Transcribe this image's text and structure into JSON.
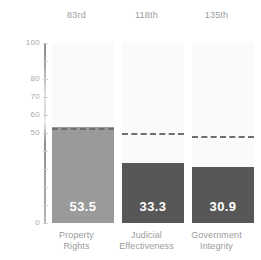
{
  "chart_data": {
    "type": "bar",
    "title": "",
    "subtitle": "",
    "xlabel": "",
    "ylabel": "",
    "ylim": [
      0,
      100
    ],
    "grid": false,
    "legend": "none",
    "categories": [
      "Property Rights",
      "Judicial Effectiveness",
      "Government Integrity"
    ],
    "category_lines": [
      [
        "Property",
        "Rights"
      ],
      [
        "Judicial",
        "Effectiveness"
      ],
      [
        "Government",
        "Integrity"
      ]
    ],
    "values": [
      53.5,
      33.3,
      30.9
    ],
    "value_labels": [
      "53.5",
      "33.3",
      "30.9"
    ],
    "rank_labels": [
      "83rd",
      "118th",
      "135th"
    ],
    "reference_lines": [
      52.6,
      49.8,
      48.4
    ],
    "reference_line_style": "dashed",
    "bar_colors": [
      "#9a9a9a",
      "#575757",
      "#575757"
    ],
    "y_ticks": [
      {
        "value": 100,
        "label": "100"
      },
      {
        "value": 90,
        "label": ""
      },
      {
        "value": 80,
        "label": "80"
      },
      {
        "value": 70,
        "label": "70"
      },
      {
        "value": 60,
        "label": "60"
      },
      {
        "value": 50,
        "label": "50"
      },
      {
        "value": 40,
        "label": ""
      },
      {
        "value": 30,
        "label": ""
      },
      {
        "value": 20,
        "label": ""
      },
      {
        "value": 10,
        "label": ""
      },
      {
        "value": 0,
        "label": "0"
      }
    ],
    "colors": {
      "bar_light": "#9a9a9a",
      "bar_dark": "#575757",
      "band": "#fafafa",
      "axis": "#9a9a9a",
      "dash": "#6f6f6f",
      "text": "#9b9b9b",
      "value_text": "#ffffff",
      "background": "#ffffff"
    }
  }
}
